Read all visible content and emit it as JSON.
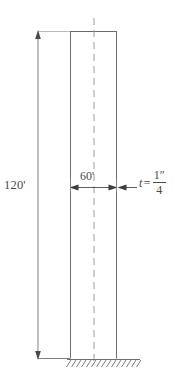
{
  "figure": {
    "kind": "engineering-elevation-diagram",
    "colors": {
      "line": "#4a4a4a",
      "light_line": "#9a9a9a",
      "text": "#4a4a4a",
      "background": "#ffffff"
    }
  },
  "labels": {
    "height": "120'",
    "width": "60'",
    "thickness_variable": "t",
    "thickness_equals": "=",
    "thickness_numerator": "1″",
    "thickness_denominator": "4"
  },
  "geometry": {
    "column": {
      "left": 70,
      "right": 117,
      "top": 31,
      "bottom": 358
    },
    "centerline_x": 94,
    "height_dimension_x": 38,
    "width_dimension_y": 187,
    "ground_y": 359
  }
}
